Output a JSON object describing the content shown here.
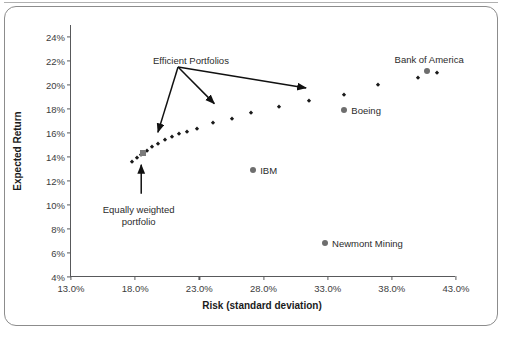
{
  "chart_data": {
    "type": "scatter",
    "title": "",
    "xlabel": "Risk (standard deviation)",
    "ylabel": "Expected Return",
    "xlim": [
      13.0,
      43.0
    ],
    "ylim": [
      4.0,
      25.0
    ],
    "grid": false,
    "legend": "none",
    "xticks": [
      "13.0%",
      "18.0%",
      "23.0%",
      "28.0%",
      "33.0%",
      "38.0%",
      "43.0%"
    ],
    "xtick_values": [
      13.0,
      18.0,
      23.0,
      28.0,
      33.0,
      38.0,
      43.0
    ],
    "yticks": [
      "4%",
      "6%",
      "8%",
      "10%",
      "12%",
      "14%",
      "16%",
      "18%",
      "20%",
      "22%",
      "24%"
    ],
    "ytick_values": [
      4,
      6,
      8,
      10,
      12,
      14,
      16,
      18,
      20,
      22,
      24
    ],
    "series": [
      {
        "name": "Efficient Portfolios",
        "marker": "diamond",
        "color": "#1a1a1a",
        "points": [
          {
            "x": 17.75,
            "y": 13.6
          },
          {
            "x": 18.15,
            "y": 13.95
          },
          {
            "x": 18.45,
            "y": 14.2
          },
          {
            "x": 18.95,
            "y": 14.5
          },
          {
            "x": 19.35,
            "y": 14.8
          },
          {
            "x": 19.8,
            "y": 15.1
          },
          {
            "x": 20.3,
            "y": 15.45
          },
          {
            "x": 20.85,
            "y": 15.65
          },
          {
            "x": 21.4,
            "y": 15.9
          },
          {
            "x": 22.05,
            "y": 16.1
          },
          {
            "x": 22.85,
            "y": 16.35
          },
          {
            "x": 24.1,
            "y": 16.8
          },
          {
            "x": 25.55,
            "y": 17.15
          },
          {
            "x": 27.05,
            "y": 17.65
          },
          {
            "x": 29.2,
            "y": 18.15
          },
          {
            "x": 31.55,
            "y": 18.7
          },
          {
            "x": 34.3,
            "y": 19.15
          },
          {
            "x": 36.95,
            "y": 20.0
          },
          {
            "x": 40.0,
            "y": 20.55
          },
          {
            "x": 41.5,
            "y": 21.0
          }
        ]
      },
      {
        "name": "Equally weighted portfolio",
        "marker": "square",
        "color": "#7a7a7a",
        "points": [
          {
            "x": 18.6,
            "y": 14.3
          }
        ]
      },
      {
        "name": "Individual stocks",
        "marker": "circle",
        "color": "#6e6e6e",
        "points": [
          {
            "x": 27.2,
            "y": 12.9,
            "label": "IBM"
          },
          {
            "x": 34.3,
            "y": 17.9,
            "label": "Boeing"
          },
          {
            "x": 32.8,
            "y": 6.8,
            "label": "Newmont Mining"
          },
          {
            "x": 40.75,
            "y": 21.15,
            "label": "Bank of America"
          }
        ]
      }
    ],
    "annotations": [
      {
        "text": "Efficient Portfolios",
        "x": 23.6,
        "y": 22.0,
        "arrow_targets": [
          {
            "x": 19.85,
            "y": 16.05
          },
          {
            "x": 24.25,
            "y": 18.45
          },
          {
            "x": 31.4,
            "y": 19.75
          }
        ]
      },
      {
        "text_line1": "Equally weighted",
        "text_line2": "portfolio",
        "x": 18.35,
        "y": 9.6,
        "arrow_target": {
          "x": 18.55,
          "y": 13.35
        }
      }
    ]
  },
  "axes": {
    "y_title": "Expected Return",
    "x_title": "Risk (standard deviation)"
  },
  "labels": {
    "efficient_portfolios": "Efficient Portfolios",
    "equally_weighted_line1": "Equally weighted",
    "equally_weighted_line2": "portfolio",
    "ibm": "IBM",
    "boeing": "Boeing",
    "newmont": "Newmont Mining",
    "bofa": "Bank of America"
  },
  "colors": {
    "frontier_marker": "#1a1a1a",
    "stock_marker": "#6e6e6e",
    "equal_weight_marker": "#7a7a7a",
    "axis": "#58595b",
    "frame": "#8c8c8c",
    "text": "#2b2b2b"
  }
}
